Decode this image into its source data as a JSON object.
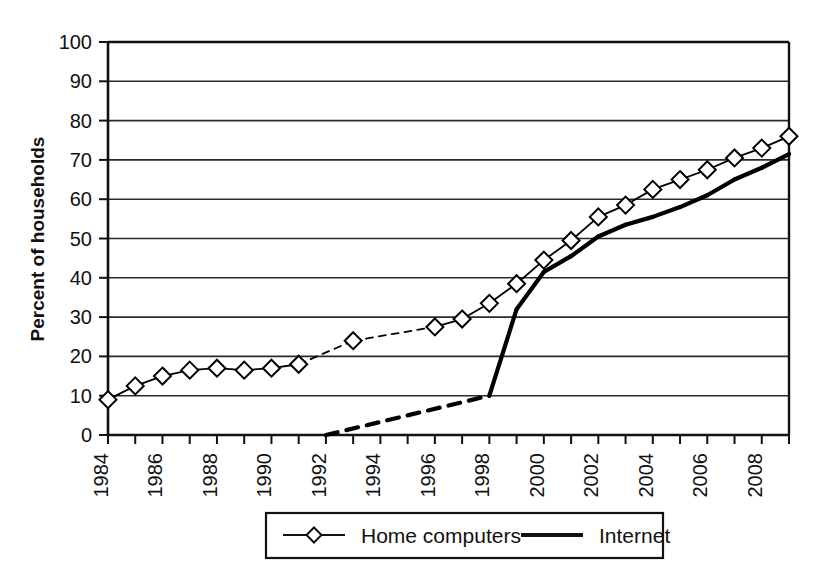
{
  "chart_data": {
    "type": "line",
    "title": "",
    "xlabel": "",
    "ylabel": "Percent of households",
    "xlim": [
      1984,
      2009
    ],
    "ylim": [
      0,
      100
    ],
    "grid": true,
    "legend_position": "bottom-center",
    "y_ticks": [
      0,
      10,
      20,
      30,
      40,
      50,
      60,
      70,
      80,
      90,
      100
    ],
    "y_tick_labels": [
      "0",
      "10",
      "20",
      "30",
      "40",
      "50",
      "60",
      "70",
      "80",
      "90",
      "100"
    ],
    "x_ticks": [
      1984,
      1985,
      1986,
      1987,
      1988,
      1989,
      1990,
      1991,
      1992,
      1993,
      1994,
      1995,
      1996,
      1997,
      1998,
      1999,
      2000,
      2001,
      2002,
      2003,
      2004,
      2005,
      2006,
      2007,
      2008,
      2009
    ],
    "x_tick_labels": [
      "1984",
      "",
      "1986",
      "",
      "1988",
      "",
      "1990",
      "",
      "1992",
      "",
      "1994",
      "",
      "1996",
      "",
      "1998",
      "",
      "2000",
      "",
      "2002",
      "",
      "2004",
      "",
      "2006",
      "",
      "2008",
      ""
    ],
    "series": [
      {
        "name": "Home computers",
        "marker": "diamond",
        "line_style": "solid-with-dashed-gaps",
        "color": "#000000",
        "x": [
          1984,
          1985,
          1986,
          1987,
          1988,
          1989,
          1990,
          1991,
          1993,
          1996,
          1997,
          1998,
          1999,
          2000,
          2001,
          2002,
          2003,
          2004,
          2005,
          2006,
          2007,
          2008,
          2009
        ],
        "values": [
          9,
          12.5,
          15,
          16.5,
          17,
          16.5,
          17,
          18,
          24,
          27.5,
          29.5,
          33.5,
          38.5,
          44.5,
          49.5,
          55.5,
          58.5,
          62.5,
          65,
          67.5,
          70.5,
          73,
          76
        ],
        "dashed_segments": [
          [
            1991,
            1993
          ],
          [
            1993,
            1996
          ]
        ]
      },
      {
        "name": "Internet",
        "marker": "none",
        "line_style": "dashed-then-solid",
        "color": "#000000",
        "x": [
          1992,
          1998,
          1999,
          2000,
          2001,
          2002,
          2003,
          2004,
          2005,
          2006,
          2007,
          2008,
          2009
        ],
        "values": [
          0,
          10,
          32,
          41.5,
          45.5,
          50.5,
          53.5,
          55.5,
          58,
          61,
          65,
          68,
          71.5
        ],
        "dashed_segments": [
          [
            1992,
            1998
          ]
        ]
      }
    ]
  },
  "legend": {
    "items": [
      {
        "label": "Home computers",
        "marker": "diamond",
        "style": "thin-line-with-marker"
      },
      {
        "label": "Internet",
        "marker": "none",
        "style": "thick-solid-line"
      }
    ]
  },
  "colors": {
    "ink": "#111111",
    "grid": "#2a2a2a",
    "background": "#ffffff"
  }
}
